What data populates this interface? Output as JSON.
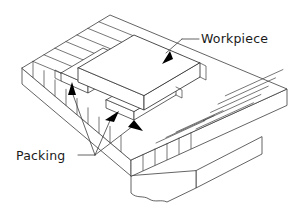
{
  "figure": {
    "type": "isometric-line-drawing",
    "background_color": "#ffffff",
    "line_color": "#3c3c3c",
    "arrow_color": "#000000",
    "text_color": "#1a1a1a"
  },
  "labels": {
    "workpiece": "Workpiece",
    "packing": "Packing"
  },
  "annotations": [
    {
      "name": "workpiece-callout",
      "text": "Workpiece",
      "arrow_count": 1,
      "points_to": "top slab resting on packing strips"
    },
    {
      "name": "packing-callout",
      "text": "Packing",
      "arrow_count": 3,
      "points_to": "packing strips between workpiece and table"
    }
  ],
  "parts": [
    {
      "name": "machine-table",
      "description": "ribbed slotted table top"
    },
    {
      "name": "packing-strips",
      "description": "thin parallel strips under workpiece"
    },
    {
      "name": "workpiece",
      "description": "rectangular slab on top"
    },
    {
      "name": "table-base",
      "description": "pedestal below table with break line"
    }
  ]
}
